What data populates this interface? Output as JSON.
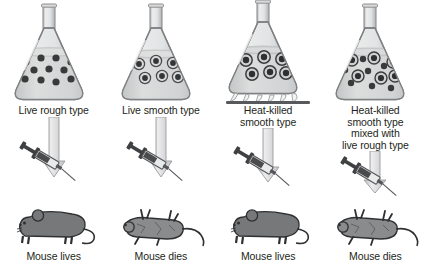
{
  "figure": {
    "background_color": "#ffffff",
    "text_color": "#231f20",
    "glass_color": "#c9cacb",
    "liquid_color": "#d3d4d5",
    "cell_dark_color": "#3a3a3a",
    "cell_ring_color": "#d8d9da",
    "mouse_live_color": "#77787a",
    "mouse_dead_color": "#8a8b8d",
    "arrow_color": "#d9dadb",
    "burner_color": "#58595b"
  },
  "columns": [
    {
      "id": "live-rough",
      "treatment_label": "Live rough type",
      "outcome_label": "Mouse lives",
      "flask": {
        "heated": false,
        "cell_type": "rough",
        "cells": [
          {
            "cx": 18,
            "cy": 62,
            "r": 3.6,
            "type": "rough"
          },
          {
            "cx": 33,
            "cy": 58,
            "r": 3.6,
            "type": "rough"
          },
          {
            "cx": 48,
            "cy": 58,
            "r": 3.6,
            "type": "rough"
          },
          {
            "cx": 63,
            "cy": 62,
            "r": 3.6,
            "type": "rough"
          },
          {
            "cx": 26,
            "cy": 70,
            "r": 3.6,
            "type": "rough"
          },
          {
            "cx": 41,
            "cy": 69,
            "r": 3.6,
            "type": "rough"
          },
          {
            "cx": 56,
            "cy": 70,
            "r": 3.6,
            "type": "rough"
          },
          {
            "cx": 17,
            "cy": 79,
            "r": 3.6,
            "type": "rough"
          },
          {
            "cx": 33,
            "cy": 80,
            "r": 3.6,
            "type": "rough"
          },
          {
            "cx": 48,
            "cy": 82,
            "r": 3.6,
            "type": "rough"
          },
          {
            "cx": 63,
            "cy": 79,
            "r": 3.6,
            "type": "rough"
          }
        ]
      },
      "mouse_state": "alive"
    },
    {
      "id": "live-smooth",
      "treatment_label": "Live smooth type",
      "outcome_label": "Mouse dies",
      "flask": {
        "heated": false,
        "cell_type": "smooth",
        "cells": [
          {
            "cx": 24,
            "cy": 64,
            "r": 5.6,
            "type": "smooth"
          },
          {
            "cx": 41,
            "cy": 61,
            "r": 5.6,
            "type": "smooth"
          },
          {
            "cx": 58,
            "cy": 63,
            "r": 5.6,
            "type": "smooth"
          },
          {
            "cx": 30,
            "cy": 78,
            "r": 5.6,
            "type": "smooth"
          },
          {
            "cx": 47,
            "cy": 76,
            "r": 5.6,
            "type": "smooth"
          },
          {
            "cx": 63,
            "cy": 77,
            "r": 5.6,
            "type": "smooth"
          }
        ]
      },
      "mouse_state": "alive"
    },
    {
      "id": "heat-killed-smooth",
      "treatment_label": "Heat-killed\nsmooth type",
      "outcome_label": "Mouse lives",
      "flask": {
        "heated": true,
        "cell_type": "smooth",
        "cells": [
          {
            "cx": 24,
            "cy": 60,
            "r": 6.2,
            "type": "smooth"
          },
          {
            "cx": 42,
            "cy": 57,
            "r": 6.2,
            "type": "smooth"
          },
          {
            "cx": 60,
            "cy": 59,
            "r": 6.2,
            "type": "smooth"
          },
          {
            "cx": 30,
            "cy": 74,
            "r": 6.2,
            "type": "smooth"
          },
          {
            "cx": 48,
            "cy": 72,
            "r": 6.2,
            "type": "smooth"
          },
          {
            "cx": 64,
            "cy": 73,
            "r": 6.2,
            "type": "smooth"
          }
        ]
      },
      "mouse_state": "alive"
    },
    {
      "id": "heat-killed-smooth-plus-live-rough",
      "treatment_label": "Heat-killed\nsmooth type\nmixed with\nlive rough type",
      "outcome_label": "Mouse dies",
      "flask": {
        "heated": false,
        "cell_type": "mixed",
        "cells": [
          {
            "cx": 23,
            "cy": 60,
            "r": 6.0,
            "type": "smooth"
          },
          {
            "cx": 45,
            "cy": 58,
            "r": 6.0,
            "type": "smooth"
          },
          {
            "cx": 64,
            "cy": 62,
            "r": 6.0,
            "type": "smooth"
          },
          {
            "cx": 29,
            "cy": 76,
            "r": 6.0,
            "type": "smooth"
          },
          {
            "cx": 52,
            "cy": 78,
            "r": 6.0,
            "type": "smooth"
          },
          {
            "cx": 66,
            "cy": 76,
            "r": 6.0,
            "type": "smooth"
          },
          {
            "cx": 34,
            "cy": 59,
            "r": 3.2,
            "type": "rough"
          },
          {
            "cx": 55,
            "cy": 66,
            "r": 3.2,
            "type": "rough"
          },
          {
            "cx": 16,
            "cy": 70,
            "r": 3.2,
            "type": "rough"
          },
          {
            "cx": 39,
            "cy": 71,
            "r": 3.2,
            "type": "rough"
          },
          {
            "cx": 22,
            "cy": 83,
            "r": 3.2,
            "type": "rough"
          },
          {
            "cx": 43,
            "cy": 86,
            "r": 3.2,
            "type": "rough"
          },
          {
            "cx": 62,
            "cy": 88,
            "r": 3.2,
            "type": "rough"
          }
        ]
      },
      "mouse_state": "dead"
    }
  ]
}
